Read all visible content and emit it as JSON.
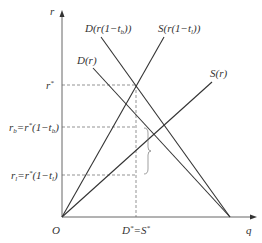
{
  "axes": {
    "y_label": "r",
    "x_label": "q",
    "origin_label": "O"
  },
  "curves": {
    "demand": "D(r)",
    "demand_taxed": "D(r(1−t",
    "demand_taxed_sub": "b",
    "supply": "S(r)",
    "supply_taxed": "S(r(1−t",
    "supply_taxed_sub": "l"
  },
  "y_ticks": {
    "r_star": "r",
    "r_b_main": "r",
    "r_b_sub": "b",
    "r_b_eq": "=r",
    "r_b_rest": "(1−t",
    "r_l_main": "r",
    "r_l_sub": "l",
    "r_l_eq": "=r",
    "r_l_rest": "(1−t"
  },
  "x_ticks": {
    "equilibrium": "D",
    "equilibrium_eq": "=S"
  },
  "colors": {
    "line": "#333333",
    "dash": "#555555",
    "brace": "#777777"
  }
}
